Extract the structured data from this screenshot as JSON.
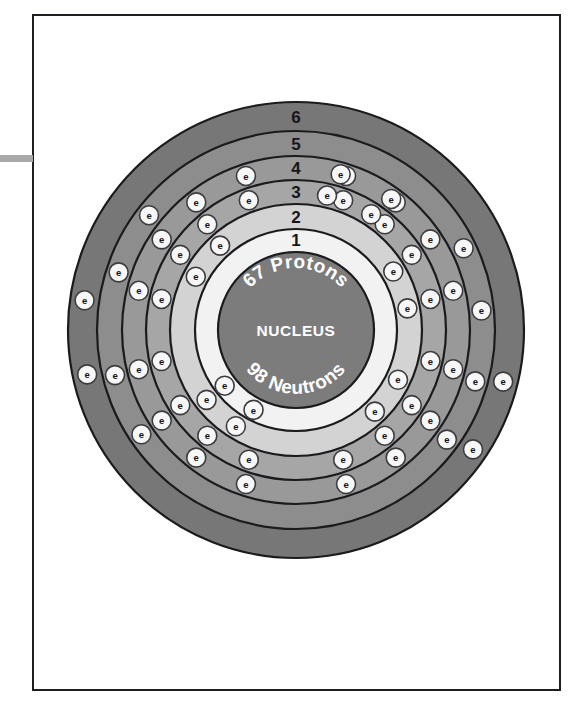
{
  "figure": {
    "kind": "bohr-atom-diagram",
    "element_note": "67 Protons / 98 Neutrons",
    "background_color": "#ffffff",
    "frame_color": "#1e1e22",
    "left_tab_color": "#a8a8a8"
  },
  "nucleus": {
    "top_arc_label": "67 Protons",
    "center_label": "NUCLEUS",
    "bottom_arc_label": "98 Neutrons",
    "fill": "#7c7c7c",
    "stroke": "#1b1b1f",
    "radius": 78
  },
  "electron": {
    "symbol": "e",
    "fill": "#f7f7f7",
    "stroke": "#3c3c40",
    "radius": 9.5
  },
  "shells": [
    {
      "number": "1",
      "label_angle_deg": -90,
      "inner_radius": 80,
      "outer_radius": 101,
      "fill": "#f2f2f2",
      "stroke": "#1b1b1f",
      "electron_count": 2,
      "electron_angles_deg": [
        118,
        142
      ]
    },
    {
      "number": "2",
      "label_angle_deg": -90,
      "inner_radius": 101,
      "outer_radius": 126,
      "fill": "#d3d3d3",
      "stroke": "#1b1b1f",
      "electron_count": 8,
      "electron_angles_deg": [
        -31,
        -11,
        26,
        46,
        122,
        142,
        208,
        228
      ]
    },
    {
      "number": "3",
      "label_angle_deg": -90,
      "inner_radius": 126,
      "outer_radius": 150,
      "fill": "#a6a6a6",
      "stroke": "#1b1b1f",
      "electron_count": 18,
      "electron_angles_deg": [
        -70,
        -50,
        -33,
        -13,
        13,
        33,
        50,
        70,
        110,
        130,
        147,
        167,
        193,
        213,
        230,
        250,
        283,
        303
      ]
    },
    {
      "number": "4",
      "label_angle_deg": -90,
      "inner_radius": 150,
      "outer_radius": 174,
      "fill": "#999999",
      "stroke": "#1b1b1f",
      "electron_count": 18,
      "electron_angles_deg": [
        -72,
        -52,
        -34,
        -14,
        14,
        34,
        52,
        72,
        108,
        128,
        146,
        166,
        194,
        214,
        232,
        252,
        286,
        306
      ]
    },
    {
      "number": "5",
      "label_angle_deg": -90,
      "inner_radius": 174,
      "outer_radius": 199,
      "fill": "#8d8d8d",
      "stroke": "#1b1b1f",
      "electron_count": 8,
      "electron_angles_deg": [
        -26,
        -6,
        16,
        36,
        146,
        166,
        198,
        218
      ]
    },
    {
      "number": "6",
      "label_angle_deg": -90,
      "inner_radius": 199,
      "outer_radius": 228,
      "fill": "#777777",
      "stroke": "#1b1b1f",
      "electron_count": 4,
      "electron_angles_deg": [
        14,
        34,
        168,
        188
      ]
    }
  ],
  "chart_data": {
    "type": "diagram",
    "categories": [
      "Shell 1",
      "Shell 2",
      "Shell 3",
      "Shell 4",
      "Shell 5",
      "Shell 6"
    ],
    "values": [
      2,
      8,
      18,
      18,
      8,
      4
    ],
    "xlabel": "Electron shell",
    "ylabel": "Electrons in shell",
    "annotations": [
      "67 Protons",
      "NUCLEUS",
      "98 Neutrons"
    ]
  }
}
